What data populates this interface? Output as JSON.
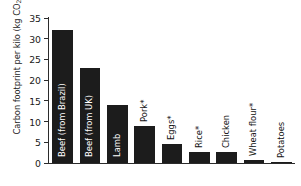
{
  "chart_data": {
    "type": "bar",
    "title": "",
    "xlabel": "",
    "ylabel": "Carbon footprint per kilo (kg CO2e)",
    "ylabel_parts": {
      "before": "Carbon footprint per kilo (kg CO",
      "sub": "2",
      "after": "e)"
    },
    "ylim": [
      0,
      35
    ],
    "ytick_values": [
      0,
      5,
      10,
      15,
      20,
      25,
      30,
      35
    ],
    "ytick_labels": [
      "0",
      "5",
      "10",
      "15",
      "20",
      "25",
      "30",
      "35"
    ],
    "grid": false,
    "legend": null,
    "bar_color": "#1c1c1c",
    "axis_color": "#2b2b2b",
    "categories": [
      "Beef (from Brazil)",
      "Beef (from UK)",
      "Lamb",
      "Pork*",
      "Eggs*",
      "Rice*",
      "Chicken",
      "Wheat flour*",
      "Potatoes"
    ],
    "values": [
      32,
      23,
      14,
      9,
      4.5,
      2.7,
      2.7,
      0.8,
      0.2
    ],
    "label_placement": [
      "inside",
      "inside",
      "inside",
      "above",
      "above",
      "above",
      "above",
      "above",
      "above"
    ],
    "footnote": "*"
  }
}
